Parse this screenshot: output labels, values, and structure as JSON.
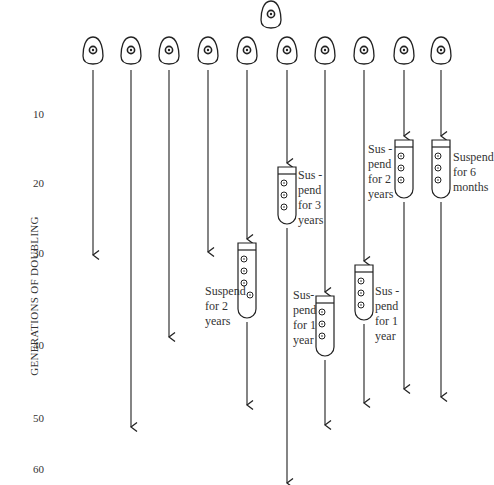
{
  "diagram": {
    "y_axis_label": "GENERATIONS OF DOUBLING",
    "y_ticks": [
      {
        "label": "10",
        "y": 115
      },
      {
        "label": "20",
        "y": 184
      },
      {
        "label": "30",
        "y": 254
      },
      {
        "label": "40",
        "y": 346
      },
      {
        "label": "50",
        "y": 419
      },
      {
        "label": "60",
        "y": 470
      }
    ],
    "parent_cell": {
      "x": 271,
      "y": 14
    },
    "lineages": [
      {
        "x": 93,
        "end": 255
      },
      {
        "x": 131,
        "end": 427
      },
      {
        "x": 169,
        "end": 337
      },
      {
        "x": 208,
        "end": 252
      },
      {
        "x": 247,
        "end": 405,
        "tube_top": 243,
        "tube_bottom": 318,
        "note": "Suspend\nfor 2\nyears",
        "note_side": "left"
      },
      {
        "x": 287,
        "end": 483,
        "tube_top": 167,
        "tube_bottom": 224,
        "note": "Sus -\npend\nfor 3\nyears",
        "note_side": "right"
      },
      {
        "x": 325,
        "end": 425,
        "tube_top": 296,
        "tube_bottom": 356,
        "note": "Sus-\npend\nfor 1\nyear",
        "note_side": "left"
      },
      {
        "x": 364,
        "end": 403,
        "tube_top": 265,
        "tube_bottom": 320,
        "note": "Sus -\npend\nfor 1\nyear",
        "note_side": "right"
      },
      {
        "x": 404,
        "end": 389,
        "tube_top": 140,
        "tube_bottom": 198,
        "note": "Sus -\npend\nfor 2\nyears",
        "note_side": "left"
      },
      {
        "x": 441,
        "end": 397,
        "tube_top": 140,
        "tube_bottom": 198,
        "note": "Suspend\nfor 6\nmonths",
        "note_side": "right"
      }
    ],
    "notes": {
      "n5": "Suspend\nfor 2\nyears",
      "n6": "Sus -\npend\nfor 3\nyears",
      "n7": "Sus-\npend\nfor 1\nyear",
      "n8": "Sus -\npend\nfor 1\nyear",
      "n9": "Sus -\npend\nfor 2\nyears",
      "n10": "Suspend\nfor 6\nmonths"
    },
    "ticks": {
      "t10": "10",
      "t20": "20",
      "t30": "30",
      "t40": "40",
      "t50": "50",
      "t60": "60"
    }
  }
}
